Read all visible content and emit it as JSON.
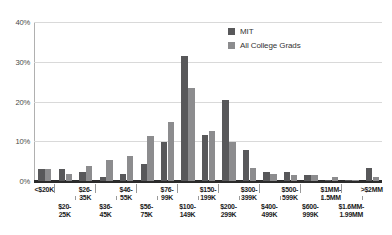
{
  "chart_data": {
    "type": "bar",
    "title": "",
    "subtitle": "",
    "xlabel": "",
    "ylabel": "",
    "ylim": [
      0,
      40
    ],
    "yticks": [
      0,
      10,
      20,
      30,
      40
    ],
    "ytick_labels": [
      "0%",
      "10%",
      "20%",
      "30%",
      "40%"
    ],
    "grid": true,
    "legend_position": "top-right",
    "categories": [
      "<$20K",
      "$20-25K",
      "$26-35K",
      "$36-45K",
      "$46-55K",
      "$56-75K",
      "$76-99K",
      "$100-149K",
      "$150-199K",
      "$200-299K",
      "$300-399K",
      "$400-499K",
      "$500-599K",
      "$600-999K",
      "$1MM-1.5MM",
      "$1.6MM-1.99MM",
      ">$2MM"
    ],
    "series": [
      {
        "name": "MIT",
        "color": "#58585a",
        "values": [
          3.0,
          3.0,
          2.3,
          0.9,
          1.8,
          4.3,
          9.8,
          31.4,
          11.5,
          20.4,
          7.8,
          2.2,
          2.2,
          1.4,
          0.2,
          0.2,
          3.4
        ]
      },
      {
        "name": "All College Grads",
        "color": "#8c8c8e",
        "values": [
          3.0,
          1.8,
          3.7,
          5.2,
          6.2,
          11.4,
          14.9,
          23.4,
          12.7,
          9.8,
          3.4,
          1.7,
          1.4,
          1.4,
          1.0,
          0.2,
          1.0
        ]
      }
    ]
  },
  "axis": {
    "y_labels": [
      "40%",
      "30%",
      "20%",
      "10%",
      "0%"
    ]
  },
  "legend": {
    "items": [
      {
        "label": "MIT",
        "swatch": "mit"
      },
      {
        "label": "All College Grads",
        "swatch": "acg"
      }
    ]
  },
  "x_axis_labels": [
    {
      "line1": "<$20K",
      "line2": "",
      "row": "top"
    },
    {
      "line1": "$20-",
      "line2": "25K",
      "row": "bot"
    },
    {
      "line1": "$26-",
      "line2": "35K",
      "row": "top"
    },
    {
      "line1": "$36-",
      "line2": "45K",
      "row": "bot"
    },
    {
      "line1": "$46-",
      "line2": "55K",
      "row": "top"
    },
    {
      "line1": "$56-",
      "line2": "75K",
      "row": "bot"
    },
    {
      "line1": "$76-",
      "line2": "99K",
      "row": "top"
    },
    {
      "line1": "$100-",
      "line2": "149K",
      "row": "bot"
    },
    {
      "line1": "$150-",
      "line2": "199K",
      "row": "top"
    },
    {
      "line1": "$200-",
      "line2": "299K",
      "row": "bot"
    },
    {
      "line1": "$300-",
      "line2": "399K",
      "row": "top"
    },
    {
      "line1": "$400-",
      "line2": "499K",
      "row": "bot"
    },
    {
      "line1": "$500-",
      "line2": "599K",
      "row": "top"
    },
    {
      "line1": "$600-",
      "line2": "999K",
      "row": "bot"
    },
    {
      "line1": "$1MM-",
      "line2": "1.5MM",
      "row": "top"
    },
    {
      "line1": "$1.6MM-",
      "line2": "1.99MM",
      "row": "bot"
    },
    {
      "line1": ">$2MM",
      "line2": "",
      "row": "top"
    }
  ],
  "colors": {
    "mit": "#58585a",
    "all_college_grads": "#8c8c8e",
    "gridline": "#d9d9d9",
    "baseline": "#2b2b2b",
    "text": "#1a1a1a"
  }
}
